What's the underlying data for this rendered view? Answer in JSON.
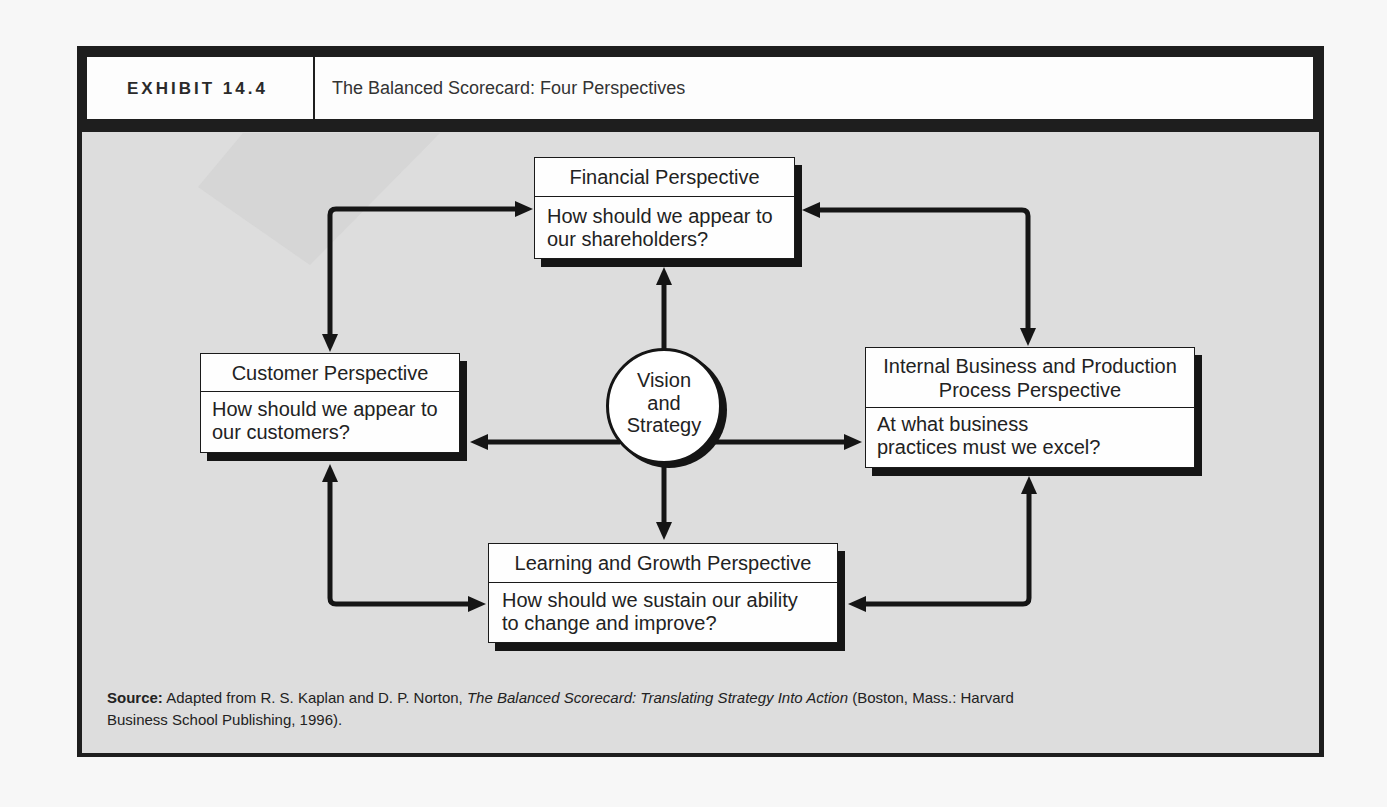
{
  "exhibit": {
    "label": "EXHIBIT 14.4",
    "title": "The Balanced Scorecard: Four Perspectives"
  },
  "diagram": {
    "center": {
      "lines": [
        "Vision",
        "and",
        "Strategy"
      ]
    },
    "perspectives": {
      "financial": {
        "title_lines": [
          "Financial Perspective"
        ],
        "question_lines": [
          "How should we appear to",
          "our shareholders?"
        ]
      },
      "customer": {
        "title_lines": [
          "Customer Perspective"
        ],
        "question_lines": [
          "How should we appear to",
          "our customers?"
        ]
      },
      "internal": {
        "title_lines": [
          "Internal Business and Production",
          "Process Perspective"
        ],
        "question_lines": [
          "At what business",
          "practices must we excel?"
        ]
      },
      "learning": {
        "title_lines": [
          "Learning and Growth Perspective"
        ],
        "question_lines": [
          "How should we sustain our ability",
          "to change and improve?"
        ]
      }
    },
    "connections": [
      {
        "from": "customer",
        "to": "financial",
        "type": "bidirectional"
      },
      {
        "from": "financial",
        "to": "internal",
        "type": "bidirectional"
      },
      {
        "from": "customer",
        "to": "learning",
        "type": "bidirectional"
      },
      {
        "from": "internal",
        "to": "learning",
        "type": "bidirectional"
      },
      {
        "from": "center",
        "to": "financial",
        "type": "directed"
      },
      {
        "from": "center",
        "to": "customer",
        "type": "directed"
      },
      {
        "from": "center",
        "to": "internal",
        "type": "directed"
      },
      {
        "from": "center",
        "to": "learning",
        "type": "directed"
      }
    ]
  },
  "source": {
    "label": "Source:",
    "pre": " Adapted from R. S. Kaplan and D. P. Norton, ",
    "book_title": "The Balanced Scorecard: Translating Strategy Into Action",
    "post_line1": " (Boston, Mass.: Harvard",
    "post_line2": "Business School Publishing, 1996)."
  },
  "colors": {
    "frame": "#1e1e1e",
    "panel": "#dddddd",
    "box_fill": "#fefefe",
    "ink": "#151515"
  }
}
